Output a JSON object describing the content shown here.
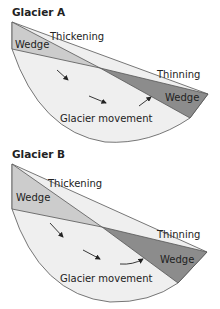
{
  "colors": {
    "glacier_fill": "#efefef",
    "thickening_wedge": "#cccccc",
    "thinning_wedge": "#8c8c8c",
    "outline": "#555555",
    "text": "#222222"
  },
  "glaciers": [
    {
      "title": "Glacier A",
      "thickening_label": "Thickening",
      "left_wedge_label": "Wedge",
      "thinning_label": "Thinning",
      "right_wedge_label": "Wedge",
      "movement_label": "Glacier movement",
      "arrow_count": 3
    },
    {
      "title": "Glacier B",
      "thickening_label": "Thickening",
      "left_wedge_label": "Wedge",
      "thinning_label": "Thinning",
      "right_wedge_label": "Wedge",
      "movement_label": "Glacier movement",
      "arrow_count": 3
    }
  ]
}
